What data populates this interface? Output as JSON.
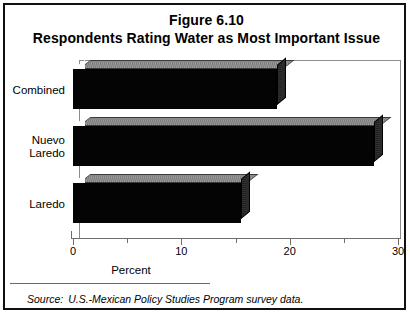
{
  "figure": {
    "title_line_1": "Figure 6.10",
    "title_line_2": "Respondents Rating Water as Most Important Issue",
    "source_keyword": "Source:",
    "source_text": "U.S.-Mexican Policy Studies Program survey data."
  },
  "chart_data": {
    "type": "bar",
    "orientation": "horizontal",
    "title": "Respondents Rating Water as Most Important Issue",
    "figure_number": "Figure 6.10",
    "categories": [
      "Combined",
      "Nuevo\nLaredo",
      "Laredo"
    ],
    "category_labels_flat": [
      "Combined",
      "Nuevo Laredo",
      "Laredo"
    ],
    "values": [
      18.8,
      27.8,
      15.5
    ],
    "xlabel": "Percent",
    "ylabel": "",
    "xlim": [
      0,
      30
    ],
    "xticks": [
      0,
      10,
      20,
      30
    ],
    "xtick_labels": [
      "0",
      "10",
      "20",
      "30"
    ],
    "minor_xticks": [
      5,
      15,
      25
    ],
    "grid": false,
    "legend": false,
    "style": "3d-bar",
    "bar_face_color": "#040404",
    "bar_top_color": "#a0a0a0",
    "bar_side_color": "#1d1d1d",
    "axis_color": "#6e6e6e",
    "border_color": "#101010",
    "background_color": "#ffffff"
  }
}
